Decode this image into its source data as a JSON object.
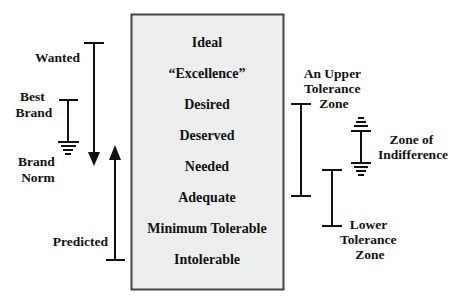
{
  "diagram": {
    "colors": {
      "ink": "#111111",
      "box_fill": "#eceeee",
      "box_stroke": "#444444",
      "background": "#ffffff"
    },
    "box": {
      "levels": [
        "Ideal",
        "“Excellence”",
        "Desired",
        "Deserved",
        "Needed",
        "Adequate",
        "Minimum Tolerable",
        "Intolerable"
      ]
    },
    "left_markers": {
      "wanted": {
        "label": "Wanted"
      },
      "best_brand": {
        "label_line1": "Best",
        "label_line2": "Brand"
      },
      "brand_norm": {
        "label_line1": "Brand",
        "label_line2": "Norm"
      },
      "predicted": {
        "label": "Predicted"
      }
    },
    "right_markers": {
      "upper_tolerance": {
        "label_line1": "An Upper",
        "label_line2": "Tolerance",
        "label_line3": "Zone"
      },
      "indifference": {
        "label_line1": "Zone of",
        "label_line2": "Indifference"
      },
      "lower_tolerance": {
        "label_line1": "Lower",
        "label_line2": "Tolerance",
        "label_line3": "Zone"
      }
    }
  }
}
